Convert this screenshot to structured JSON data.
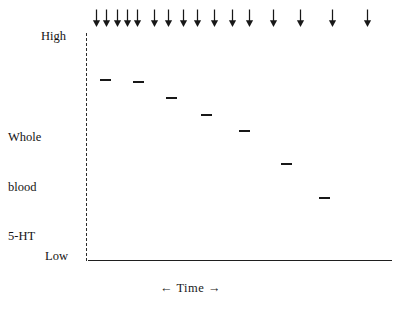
{
  "figure": {
    "name": "whole-blood-5ht-decline-schematic",
    "background_color": "#ffffff",
    "ink_color": "#181818"
  },
  "axes": {
    "y": {
      "label_lines": [
        "Whole",
        "blood",
        "5-HT"
      ],
      "label_text": "Whole blood 5-HT",
      "tick_high": "High",
      "tick_low": "Low",
      "style": "dashed",
      "color": "#2b2b2b"
    },
    "x": {
      "label": "← Time →",
      "label_plain": "Time",
      "arrow_left": "←",
      "arrow_right": "→",
      "style": "solid",
      "color": "#1f1f1f"
    }
  },
  "annotations": {
    "dose_arrow_glyph": "↓",
    "dose_arrow_name": "down-arrow-icon",
    "dose_arrow_count": 16,
    "dose_arrow_x": [
      96,
      106,
      117,
      127,
      137,
      154,
      168,
      183,
      197,
      214,
      232,
      249,
      273,
      300,
      332,
      367
    ],
    "dose_arrow_description": "Repeated dosing events marked above the plot, spacing increases left to right"
  },
  "chart_data": {
    "type": "scatter",
    "title": "",
    "subtitle": "",
    "xlabel": "← Time →",
    "ylabel": "Whole blood 5-HT",
    "grid": false,
    "legend": null,
    "ylim": [
      0,
      1
    ],
    "ytick_labels": [
      "Low",
      "High"
    ],
    "ytick_values": [
      0,
      1
    ],
    "xtick_labels": [],
    "marker": "horizontal-dash",
    "series": [
      {
        "name": "Whole blood 5-HT",
        "marker_color": "#181818",
        "points": [
          {
            "index": 1,
            "x_px": 101,
            "y_px": 79,
            "x_frac": 0.043,
            "y_level": 0.797
          },
          {
            "index": 2,
            "x_px": 134,
            "y_px": 81,
            "x_frac": 0.152,
            "y_level": 0.788
          },
          {
            "index": 3,
            "x_px": 167,
            "y_px": 97,
            "x_frac": 0.26,
            "y_level": 0.718
          },
          {
            "index": 4,
            "x_px": 202,
            "y_px": 114,
            "x_frac": 0.375,
            "y_level": 0.643
          },
          {
            "index": 5,
            "x_px": 240,
            "y_px": 130,
            "x_frac": 0.5,
            "y_level": 0.573
          },
          {
            "index": 6,
            "x_px": 282,
            "y_px": 163,
            "x_frac": 0.638,
            "y_level": 0.428
          },
          {
            "index": 7,
            "x_px": 320,
            "y_px": 197,
            "x_frac": 0.763,
            "y_level": 0.278
          }
        ]
      }
    ],
    "annotation_arrows": {
      "glyph": "↓",
      "count": 16,
      "x_px": [
        96,
        106,
        117,
        127,
        137,
        154,
        168,
        183,
        197,
        214,
        232,
        249,
        273,
        300,
        332,
        367
      ]
    }
  }
}
